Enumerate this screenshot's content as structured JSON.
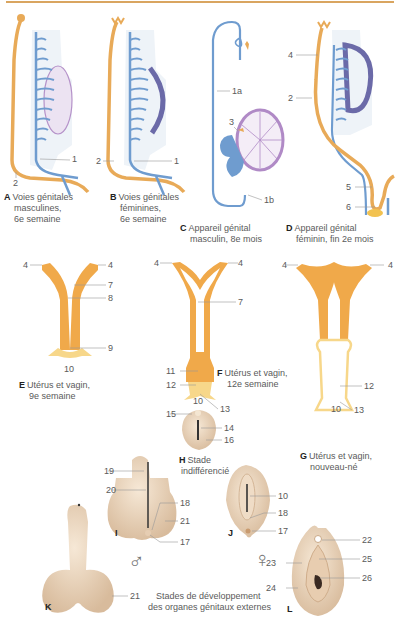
{
  "figure": {
    "panels": [
      {
        "letter": "A",
        "lines": [
          "Voies génitales",
          "masculines,",
          "6e semaine"
        ]
      },
      {
        "letter": "B",
        "lines": [
          "Voies génitales",
          "féminines,",
          "6e semaine"
        ]
      },
      {
        "letter": "C",
        "lines": [
          "Appareil génital",
          "masculin, 8e mois"
        ]
      },
      {
        "letter": "D",
        "lines": [
          "Appareil génital",
          "féminin, fin 2e mois"
        ]
      },
      {
        "letter": "E",
        "lines": [
          "Utérus et vagin,",
          "9e semaine"
        ]
      },
      {
        "letter": "F",
        "lines": [
          "Utérus et vagin,",
          "12e semaine"
        ]
      },
      {
        "letter": "G",
        "lines": [
          "Utérus et vagin,",
          "nouveau-né"
        ]
      },
      {
        "letter": "H",
        "lines": [
          "Stade",
          "indifférencié"
        ]
      },
      {
        "letter": "I",
        "lines": []
      },
      {
        "letter": "J",
        "lines": []
      },
      {
        "letter": "K",
        "lines": []
      },
      {
        "letter": "L",
        "lines": []
      }
    ],
    "external_caption": [
      "Stades de développement",
      "des organes génitaux externes"
    ],
    "symbols": {
      "male": "♂",
      "female": "♀"
    },
    "labels": {
      "A": [
        "1",
        "2"
      ],
      "B": [
        "2",
        "1"
      ],
      "C": [
        "1a",
        "3",
        "1b"
      ],
      "D": [
        "4",
        "2",
        "5",
        "6"
      ],
      "E": [
        "4",
        "4",
        "7",
        "8",
        "9",
        "10"
      ],
      "F": [
        "4",
        "4",
        "7",
        "11",
        "12",
        "10",
        "13"
      ],
      "G": [
        "4",
        "4",
        "12",
        "10",
        "13"
      ],
      "H": [
        "15",
        "14",
        "16"
      ],
      "I": [
        "19",
        "20",
        "18",
        "21",
        "17"
      ],
      "J": [
        "10",
        "18",
        "17"
      ],
      "K": [
        "21"
      ],
      "L": [
        "22",
        "25",
        "23",
        "26",
        "24"
      ]
    },
    "colors": {
      "rule": "#d9a560",
      "mullerian": "#f0a94a",
      "wolffian": "#6f9ccf",
      "gonad_male": "#b08ac6",
      "gonad_female": "#6b6aa8",
      "sinus": "#f7d78a",
      "skin": "#ecd6bd"
    }
  }
}
